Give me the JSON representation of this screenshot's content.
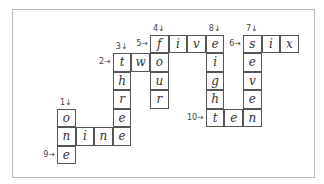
{
  "puzzle": {
    "cells": [
      {
        "r": 0,
        "c": 5,
        "ch": "f"
      },
      {
        "r": 0,
        "c": 6,
        "ch": "i"
      },
      {
        "r": 0,
        "c": 7,
        "ch": "v"
      },
      {
        "r": 0,
        "c": 8,
        "ch": "e"
      },
      {
        "r": 0,
        "c": 10,
        "ch": "s"
      },
      {
        "r": 0,
        "c": 11,
        "ch": "i"
      },
      {
        "r": 0,
        "c": 12,
        "ch": "x"
      },
      {
        "r": 1,
        "c": 3,
        "ch": "t"
      },
      {
        "r": 1,
        "c": 4,
        "ch": "w"
      },
      {
        "r": 1,
        "c": 5,
        "ch": "o"
      },
      {
        "r": 1,
        "c": 8,
        "ch": "i"
      },
      {
        "r": 1,
        "c": 10,
        "ch": "e"
      },
      {
        "r": 2,
        "c": 3,
        "ch": "h"
      },
      {
        "r": 2,
        "c": 5,
        "ch": "u"
      },
      {
        "r": 2,
        "c": 8,
        "ch": "g"
      },
      {
        "r": 2,
        "c": 10,
        "ch": "v"
      },
      {
        "r": 3,
        "c": 3,
        "ch": "r"
      },
      {
        "r": 3,
        "c": 5,
        "ch": "r"
      },
      {
        "r": 3,
        "c": 8,
        "ch": "h"
      },
      {
        "r": 3,
        "c": 10,
        "ch": "e"
      },
      {
        "r": 4,
        "c": 0,
        "ch": "o"
      },
      {
        "r": 4,
        "c": 3,
        "ch": "e"
      },
      {
        "r": 4,
        "c": 8,
        "ch": "t"
      },
      {
        "r": 4,
        "c": 9,
        "ch": "e"
      },
      {
        "r": 4,
        "c": 10,
        "ch": "n"
      },
      {
        "r": 5,
        "c": 0,
        "ch": "n"
      },
      {
        "r": 5,
        "c": 1,
        "ch": "i"
      },
      {
        "r": 5,
        "c": 2,
        "ch": "n"
      },
      {
        "r": 5,
        "c": 3,
        "ch": "e"
      },
      {
        "r": 6,
        "c": 0,
        "ch": "e"
      }
    ],
    "clues": [
      {
        "label": "1↓",
        "r": 4,
        "c": 0,
        "dir": "down"
      },
      {
        "label": "2→",
        "r": 1,
        "c": 3,
        "dir": "across"
      },
      {
        "label": "3↓",
        "r": 1,
        "c": 3,
        "dir": "down"
      },
      {
        "label": "4↓",
        "r": 0,
        "c": 5,
        "dir": "down"
      },
      {
        "label": "5→",
        "r": 0,
        "c": 5,
        "dir": "across"
      },
      {
        "label": "6→",
        "r": 0,
        "c": 10,
        "dir": "across"
      },
      {
        "label": "7↓",
        "r": 0,
        "c": 10,
        "dir": "down"
      },
      {
        "label": "8↓",
        "r": 0,
        "c": 8,
        "dir": "down"
      },
      {
        "label": "9→",
        "r": 6,
        "c": 0,
        "dir": "across"
      },
      {
        "label": "10→",
        "r": 4,
        "c": 8,
        "dir": "across"
      }
    ],
    "words": {
      "across": [
        "two",
        "five",
        "six",
        "nine",
        "ten",
        "one"
      ],
      "down": [
        "one",
        "three",
        "four",
        "seven",
        "eight"
      ]
    }
  }
}
